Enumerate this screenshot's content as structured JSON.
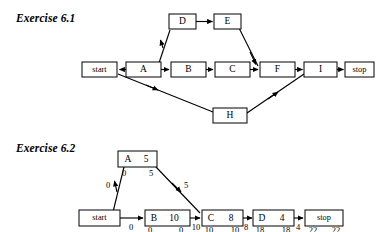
{
  "page": {
    "background": "#ffffff",
    "ink": "#000000"
  },
  "exercise_61": {
    "title": "Exercise 6.1",
    "nodes": [
      {
        "id": "start",
        "label": "start",
        "x": 82,
        "y": 62,
        "w": 35,
        "h": 15
      },
      {
        "id": "A",
        "label": "A",
        "x": 126,
        "y": 62,
        "w": 35,
        "h": 15
      },
      {
        "id": "B",
        "label": "B",
        "x": 171,
        "y": 62,
        "w": 35,
        "h": 15
      },
      {
        "id": "C",
        "label": "C",
        "x": 215,
        "y": 62,
        "w": 35,
        "h": 15
      },
      {
        "id": "D",
        "label": "D",
        "x": 169,
        "y": 14,
        "w": 27,
        "h": 15
      },
      {
        "id": "E",
        "label": "E",
        "x": 214,
        "y": 14,
        "w": 27,
        "h": 15
      },
      {
        "id": "F",
        "label": "F",
        "x": 260,
        "y": 62,
        "w": 35,
        "h": 15
      },
      {
        "id": "I",
        "label": "I",
        "x": 304,
        "y": 62,
        "w": 33,
        "h": 15
      },
      {
        "id": "stop",
        "label": "stop",
        "x": 345,
        "y": 62,
        "w": 29,
        "h": 15
      },
      {
        "id": "H",
        "label": "H",
        "x": 213,
        "y": 108,
        "w": 34,
        "h": 15
      }
    ],
    "edges": [
      {
        "from": "A",
        "to": "start",
        "note": "arrow points left into start"
      },
      {
        "from": "A",
        "to": "D",
        "note": "diagonal up-right"
      },
      {
        "from": "D",
        "to": "E",
        "note": "horizontal"
      },
      {
        "from": "E",
        "to": "F",
        "note": "diagonal down-right"
      },
      {
        "from": "A",
        "to": "B",
        "note": "horizontal"
      },
      {
        "from": "B",
        "to": "C",
        "note": "horizontal"
      },
      {
        "from": "C",
        "to": "F",
        "note": "horizontal"
      },
      {
        "from": "F",
        "to": "I",
        "note": "horizontal"
      },
      {
        "from": "I",
        "to": "stop",
        "note": "horizontal"
      },
      {
        "from": "start",
        "to": "H",
        "note": "long diagonal down-right"
      },
      {
        "from": "H",
        "to": "I",
        "note": "long diagonal up-right"
      }
    ]
  },
  "exercise_62": {
    "title": "Exercise 6.2",
    "nodes": [
      {
        "id": "start",
        "label": "start",
        "duration": "",
        "early": "",
        "late": "",
        "x": 79,
        "y": 210,
        "w": 41,
        "h": 16
      },
      {
        "id": "A",
        "label": "A",
        "duration": "5",
        "early": "0",
        "late": "5",
        "x": 118,
        "y": 151,
        "w": 39,
        "h": 16
      },
      {
        "id": "B",
        "label": "B",
        "duration": "10",
        "early": "0",
        "late": "0",
        "x": 145,
        "y": 210,
        "w": 45,
        "h": 16
      },
      {
        "id": "C",
        "label": "C",
        "duration": "8",
        "early": "10",
        "late": "10",
        "x": 202,
        "y": 210,
        "w": 41,
        "h": 16
      },
      {
        "id": "D",
        "label": "D",
        "duration": "4",
        "early": "18",
        "late": "18",
        "x": 253,
        "y": 210,
        "w": 41,
        "h": 16
      },
      {
        "id": "stop",
        "label": "stop",
        "duration": "",
        "early": "22",
        "late": "22",
        "x": 305,
        "y": 210,
        "w": 38,
        "h": 16
      }
    ],
    "edges": [
      {
        "from": "start",
        "to": "A",
        "label": "0",
        "style": "diagonal-up"
      },
      {
        "from": "A",
        "to": "C",
        "label": "5",
        "style": "diagonal-down"
      },
      {
        "from": "start",
        "to": "B",
        "label": "0",
        "style": "horizontal"
      },
      {
        "from": "B",
        "to": "C",
        "label": "10",
        "style": "horizontal"
      },
      {
        "from": "C",
        "to": "D",
        "label": "8",
        "style": "horizontal"
      },
      {
        "from": "D",
        "to": "stop",
        "label": "4",
        "style": "horizontal"
      }
    ]
  }
}
